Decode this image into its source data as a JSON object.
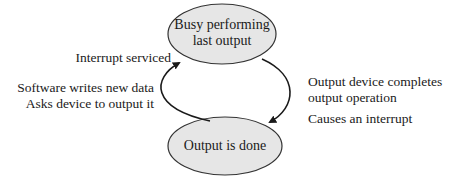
{
  "diagram": {
    "type": "state-transition",
    "colors": {
      "state_fill": "#e6e6e6",
      "state_stroke": "#333333",
      "arrow": "#1a1a1a",
      "text": "#1a1a1a",
      "background": "#ffffff"
    },
    "states": [
      {
        "id": "busy",
        "line1": "Busy performing",
        "line2": "last output"
      },
      {
        "id": "done",
        "line1": "Output is done"
      }
    ],
    "transitions": [
      {
        "from": "done",
        "to": "busy",
        "side": "left",
        "labels": {
          "top": "Interrupt serviced",
          "line1": "Software writes new data",
          "line2": "Asks device to output it"
        }
      },
      {
        "from": "busy",
        "to": "done",
        "side": "right",
        "labels": {
          "line1": "Output device completes",
          "line2": "output operation",
          "line3": "Causes an interrupt"
        }
      }
    ]
  }
}
